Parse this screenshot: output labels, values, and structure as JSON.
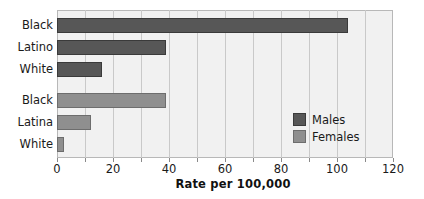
{
  "chart_data": {
    "type": "bar",
    "orientation": "horizontal",
    "title": "",
    "xlabel": "Rate per 100,000",
    "ylabel": "",
    "xlim": [
      0,
      120
    ],
    "xticks": [
      0,
      20,
      40,
      60,
      80,
      100,
      120
    ],
    "xtick_labels": [
      "0",
      "20",
      "40",
      "60",
      "80",
      "100",
      "120"
    ],
    "minor_tick_step": 10,
    "grid": true,
    "grid_axis": "x",
    "legend_position": "inside-right",
    "groups": [
      {
        "name": "Males",
        "color": "#575757",
        "categories": [
          "Black",
          "Latino",
          "White"
        ],
        "values": [
          104,
          39,
          16
        ]
      },
      {
        "name": "Females",
        "color": "#8f8f8f",
        "categories": [
          "Black",
          "Latina",
          "White"
        ],
        "values": [
          39,
          12,
          2.5
        ]
      }
    ],
    "bars": [
      {
        "label": "Black",
        "series": "Males",
        "value": 104
      },
      {
        "label": "Latino",
        "series": "Males",
        "value": 39
      },
      {
        "label": "White",
        "series": "Males",
        "value": 16
      },
      {
        "label": "Black",
        "series": "Females",
        "value": 39
      },
      {
        "label": "Latina",
        "series": "Females",
        "value": 12
      },
      {
        "label": "White",
        "series": "Females",
        "value": 2.5
      }
    ],
    "legend": [
      {
        "label": "Males",
        "color": "#575757"
      },
      {
        "label": "Females",
        "color": "#8f8f8f"
      }
    ]
  },
  "axis": {
    "x_title": "Rate per 100,000",
    "tick_labels": [
      "0",
      "20",
      "40",
      "60",
      "80",
      "100",
      "120"
    ]
  },
  "categories": {
    "males": [
      "Black",
      "Latino",
      "White"
    ],
    "females": [
      "Black",
      "Latina",
      "White"
    ]
  },
  "legend": {
    "males_label": "Males",
    "females_label": "Females"
  },
  "colors": {
    "males": "#575757",
    "females": "#8f8f8f",
    "plot_background": "#f1f1f1",
    "gridline": "#c9c9c9",
    "frame": "#b8b8b8"
  }
}
